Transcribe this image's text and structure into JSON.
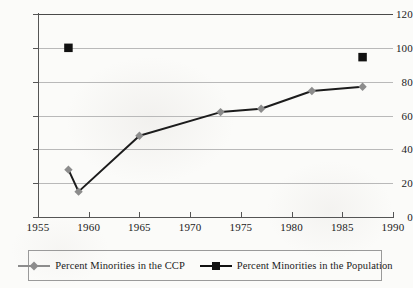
{
  "chart_data": {
    "type": "line",
    "title": "",
    "subtitle": "",
    "xlabel": "",
    "ylabel": "",
    "xlim": [
      1955,
      1990
    ],
    "ylim": [
      0,
      120
    ],
    "grid": true,
    "grid_axis": "y",
    "legend_position": "bottom",
    "x_ticks": [
      1955,
      1960,
      1965,
      1970,
      1975,
      1980,
      1985,
      1990
    ],
    "x_tick_labels": [
      "1955",
      "1960",
      "1965",
      "1970",
      "1975",
      "1980",
      "1985",
      "1990"
    ],
    "y_ticks": [
      0,
      20,
      40,
      60,
      80,
      100,
      120
    ],
    "y_tick_labels": [
      "0",
      "20",
      "40",
      "60",
      "80",
      "100",
      "120"
    ],
    "series": [
      {
        "name": "Percent Minorities in the CCP",
        "marker": "diamond",
        "marker_color": "#8c8c8c",
        "line_color": "#1c1c1c",
        "line_style": "solid",
        "x": [
          1958,
          1959,
          1965,
          1973,
          1977,
          1982,
          1987
        ],
        "values": [
          28,
          15,
          48,
          62,
          64,
          74.5,
          77
        ]
      },
      {
        "name": "Percent Minorities in the Population",
        "marker": "square",
        "marker_color": "#111111",
        "line_color": "#111111",
        "line_style": "none",
        "x": [
          1958,
          1987
        ],
        "values": [
          100,
          94.5
        ]
      }
    ]
  },
  "legend": {
    "entries": [
      {
        "label": "Percent Minorities in the CCP",
        "marker": "diamond-marker",
        "color": "#8c8c8c"
      },
      {
        "label": "Percent Minorities in the Population",
        "marker": "square-marker",
        "color": "#111111"
      }
    ]
  },
  "colors": {
    "background": "#fbfbf9",
    "gridline": "#b9b9b9",
    "axis": "#555555",
    "ccp_series": "#8c8c8c",
    "population_series": "#111111",
    "text": "#1a1a1a"
  }
}
